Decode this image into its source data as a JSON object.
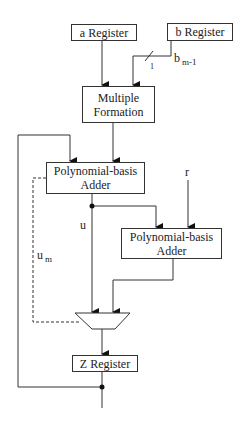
{
  "diagram": {
    "type": "block-diagram",
    "blocks": {
      "a_register": "a Register",
      "b_register": "b Register",
      "multiple_formation": "Multiple Formation",
      "adder1": "Polynomial-basis Adder",
      "adder2": "Polynomial-basis Adder",
      "z_register": "Z Register"
    },
    "labels": {
      "b_signal": "b",
      "b_signal_sub": "m-1",
      "bus_width": "1",
      "r": "r",
      "u": "u",
      "um": "u",
      "um_sub": "m"
    },
    "edges": [
      {
        "from": "a Register",
        "to": "Multiple Formation"
      },
      {
        "from": "b Register",
        "to": "Multiple Formation",
        "label": "b m-1",
        "width": "1"
      },
      {
        "from": "Multiple Formation",
        "to": "Polynomial-basis Adder (1)"
      },
      {
        "from": "Z Register",
        "to": "Polynomial-basis Adder (1)",
        "type": "feedback"
      },
      {
        "from": "Polynomial-basis Adder (1)",
        "to": "Polynomial-basis Adder (2)",
        "label": "u"
      },
      {
        "from": "r",
        "to": "Polynomial-basis Adder (2)"
      },
      {
        "from": "Polynomial-basis Adder (1)",
        "to": "Mux",
        "label": "u"
      },
      {
        "from": "Polynomial-basis Adder (2)",
        "to": "Mux"
      },
      {
        "from": "Polynomial-basis Adder (1)",
        "to": "Mux",
        "label": "u m",
        "style": "dashed",
        "role": "select"
      },
      {
        "from": "Mux",
        "to": "Z Register"
      }
    ]
  }
}
